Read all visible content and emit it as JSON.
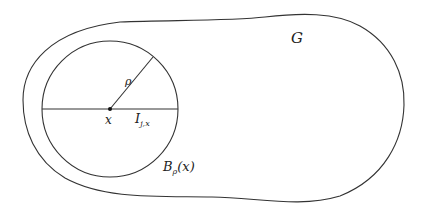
{
  "diagram": {
    "labels": {
      "domain": "G",
      "radius": "ρ",
      "center": "x",
      "segment_main": "I",
      "segment_sub": "j,x",
      "ball_main": "B",
      "ball_sub": "ρ",
      "ball_arg": "(x)"
    },
    "colors": {
      "stroke": "#333333",
      "background": "#ffffff"
    },
    "geometry": {
      "ball_center": [
        110,
        109
      ],
      "ball_radius": 68,
      "radius_endpoint": [
        153,
        57
      ]
    }
  }
}
